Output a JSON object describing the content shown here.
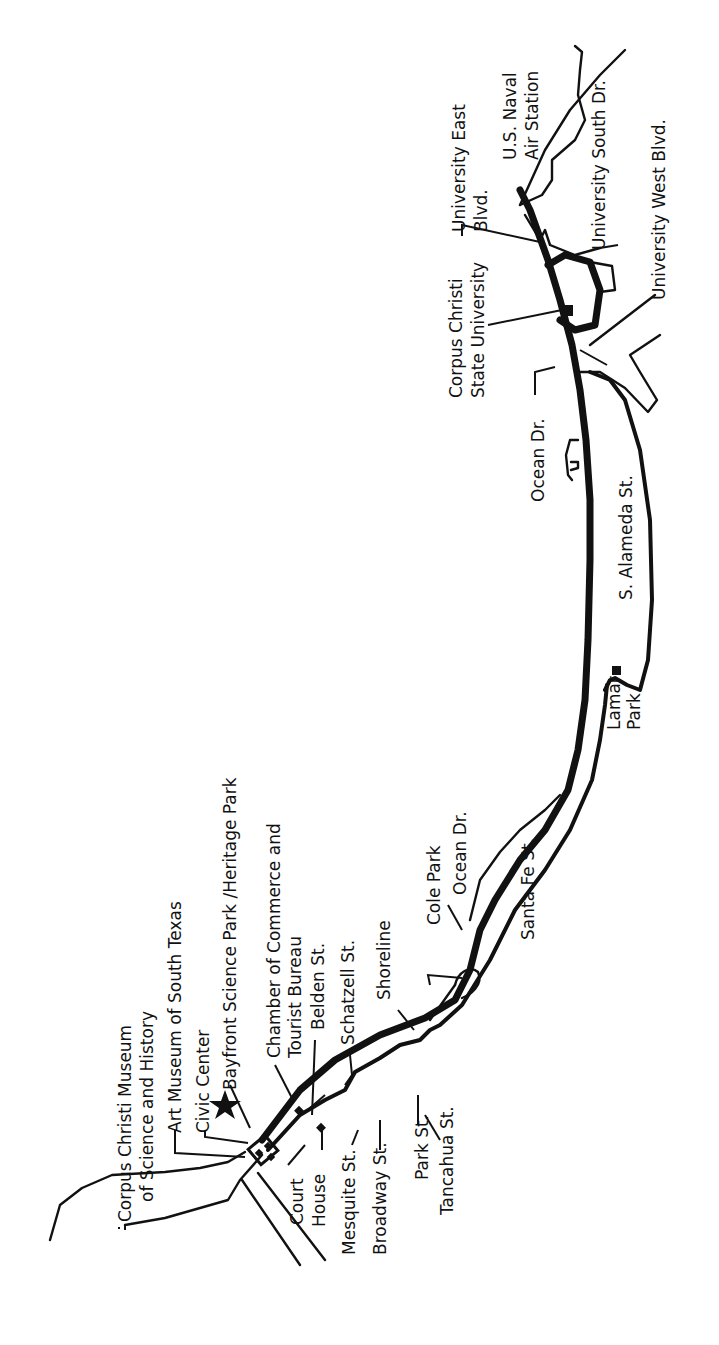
{
  "map": {
    "title": "Corpus Christi Ocean Drive area map",
    "orientation": "rotated 90 degrees counter-clockwise (labels read bottom-to-top)",
    "colors": {
      "ink": "#111111",
      "background": "#ffffff"
    },
    "labels": {
      "corpus_christi_museum_line1": "Corpus Christi Museum",
      "corpus_christi_museum_line2": "of Science and History",
      "art_museum": "Art Museum of South Texas",
      "civic_center": "Civic Center",
      "bayfront_park": "Bayfront Science Park /Heritage Park",
      "chamber_line1": "Chamber of Commerce and",
      "chamber_line2": "Tourist Bureau",
      "belden": "Belden St.",
      "schatzell": "Schatzell St.",
      "shoreline": "Shoreline",
      "court_house_line1": "Court",
      "court_house_line2": "House",
      "mesquite": "Mesquite St.",
      "broadway": "Broadway St.",
      "park_st": "Park St.",
      "tancahua": "Tancahua St.",
      "cole_park": "Cole Park",
      "ocean_dr_north": "Ocean Dr.",
      "santa_fe": "Santa Fe St.",
      "lamar_park_line1": "Lamar",
      "lamar_park_line2": "Park",
      "s_alameda": "S. Alameda St.",
      "ocean_dr_south": "Ocean Dr.",
      "ccsu_line1": "Corpus Christi",
      "ccsu_line2": "State University",
      "univ_east_line1": "University East",
      "univ_east_line2": "Blvd.",
      "naval_line1": "U.S. Naval",
      "naval_line2": "Air Station",
      "univ_south": "University South Dr.",
      "univ_west": "University West Blvd."
    },
    "icons": {
      "bayfront": "star-icon",
      "landmark": "diamond-icon",
      "park": "square-icon"
    }
  }
}
